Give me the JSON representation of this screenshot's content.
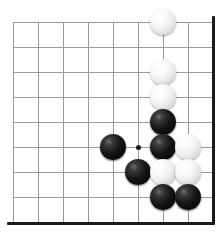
{
  "board": {
    "title": "Go board position",
    "board_size": 19,
    "visible_region": "bottom-right corner section",
    "geometry": {
      "origin_x": 13,
      "origin_y": 22,
      "cell": 25,
      "cols": 9,
      "rows": 9,
      "stone_diameter": 26,
      "right_edge_x": 212,
      "bottom_edge_y": 222
    },
    "colors": {
      "background": "#ffffff",
      "grid_line": "#9a9a9a",
      "border_line": "#1b1b1b",
      "black_stone": "#101010",
      "white_stone": "#f4f4f4"
    },
    "star_points": [
      {
        "name": "hoshi",
        "col": 5,
        "row": 5
      }
    ],
    "stones": [
      {
        "color": "white",
        "col": 6,
        "row": 0
      },
      {
        "color": "white",
        "col": 6,
        "row": 2
      },
      {
        "color": "white",
        "col": 6,
        "row": 3
      },
      {
        "color": "black",
        "col": 6,
        "row": 4
      },
      {
        "color": "black",
        "col": 4,
        "row": 5
      },
      {
        "color": "black",
        "col": 6,
        "row": 5
      },
      {
        "color": "white",
        "col": 7,
        "row": 5
      },
      {
        "color": "black",
        "col": 5,
        "row": 6
      },
      {
        "color": "white",
        "col": 6,
        "row": 6
      },
      {
        "color": "white",
        "col": 7,
        "row": 6
      },
      {
        "color": "black",
        "col": 6,
        "row": 7
      },
      {
        "color": "black",
        "col": 7,
        "row": 7
      }
    ]
  }
}
